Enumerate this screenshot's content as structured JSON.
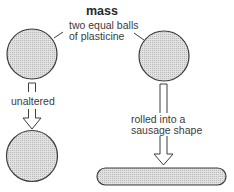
{
  "diagram": {
    "title": "mass",
    "caption_line1": "two equal balls",
    "caption_line2": "of plasticine",
    "left_branch": {
      "label": "unaltered"
    },
    "right_branch": {
      "label_line1": "rolled into a",
      "label_line2": "sausage shape"
    }
  },
  "colors": {
    "stroke": "#3c3c3c",
    "fill": "#d6d6d6",
    "background": "#ffffff"
  }
}
